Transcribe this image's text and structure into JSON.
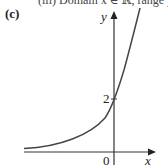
{
  "cut_text": "(iii) Domain x ∈ ℝ, range y > 0",
  "part_label": "(c)",
  "axes": {
    "x_label": "x",
    "y_label": "y",
    "origin_label": "0"
  },
  "annotations": {
    "y_intercept_label": "2"
  },
  "curve": {
    "type": "exponential",
    "y_intercept": 2,
    "asymptote": "y = 0",
    "color": "#444444"
  }
}
